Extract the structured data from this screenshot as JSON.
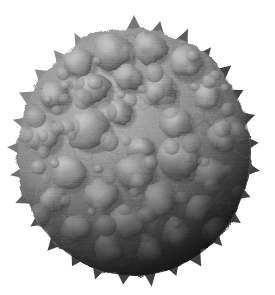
{
  "image": {
    "kind": "scientific-micrograph",
    "subject_name": "spiky-bumpy-spherical-particle",
    "description": "Grayscale electron-microscopy style rendering of a roughly spherical particle covered in rounded bumps and conical spikes, isolated on a plain white background",
    "alt_text": "Gray spherical particle with knobby bumps and spikes on white background",
    "background_color": "#ffffff",
    "render_style": "monochrome-grayscale",
    "texture": "fine horizontal scan-line striations over granular surface",
    "lighting": {
      "direction": "upper-left",
      "highlight_color": "#b9b9b9",
      "midtone_color": "#7d7d7d",
      "shadow_color": "#3a3a3a",
      "deep_shadow_color": "#232323"
    },
    "particle": {
      "center_x": 134,
      "center_y": 152,
      "radius_x": 116,
      "radius_y": 124,
      "bounds": {
        "left": 15,
        "top": 25,
        "right": 252,
        "bottom": 282
      },
      "body_fill_color": "#808080",
      "rim_shadow_color": "#2f2f2f"
    },
    "surface_features": {
      "bump_count": 58,
      "spike_count": 34,
      "bump_fill_color": "#8a8a8a",
      "bump_highlight_color": "#c2c2c2",
      "bump_shadow_color": "#404040",
      "spike_fill_color": "#707070",
      "bumps": [
        {
          "cx": 112,
          "cy": 52,
          "r": 20,
          "shade": 0.96
        },
        {
          "cx": 150,
          "cy": 48,
          "r": 15,
          "shade": 0.9
        },
        {
          "cx": 78,
          "cy": 62,
          "r": 16,
          "shade": 0.88
        },
        {
          "cx": 185,
          "cy": 62,
          "r": 17,
          "shade": 0.82
        },
        {
          "cx": 128,
          "cy": 78,
          "r": 14,
          "shade": 0.92
        },
        {
          "cx": 92,
          "cy": 88,
          "r": 18,
          "shade": 0.95
        },
        {
          "cx": 160,
          "cy": 90,
          "r": 16,
          "shade": 0.86
        },
        {
          "cx": 54,
          "cy": 96,
          "r": 15,
          "shade": 0.8
        },
        {
          "cx": 207,
          "cy": 96,
          "r": 14,
          "shade": 0.74
        },
        {
          "cx": 120,
          "cy": 112,
          "r": 13,
          "shade": 0.9
        },
        {
          "cx": 88,
          "cy": 128,
          "r": 21,
          "shade": 1.0
        },
        {
          "cx": 176,
          "cy": 122,
          "r": 16,
          "shade": 0.82
        },
        {
          "cx": 44,
          "cy": 136,
          "r": 16,
          "shade": 0.76
        },
        {
          "cx": 222,
          "cy": 136,
          "r": 14,
          "shade": 0.66
        },
        {
          "cx": 140,
          "cy": 148,
          "r": 14,
          "shade": 0.84
        },
        {
          "cx": 178,
          "cy": 158,
          "r": 21,
          "shade": 0.9
        },
        {
          "cx": 134,
          "cy": 172,
          "r": 19,
          "shade": 0.86
        },
        {
          "cx": 68,
          "cy": 172,
          "r": 17,
          "shade": 0.8
        },
        {
          "cx": 210,
          "cy": 174,
          "r": 15,
          "shade": 0.66
        },
        {
          "cx": 102,
          "cy": 196,
          "r": 17,
          "shade": 0.76
        },
        {
          "cx": 160,
          "cy": 200,
          "r": 17,
          "shade": 0.72
        },
        {
          "cx": 52,
          "cy": 200,
          "r": 14,
          "shade": 0.66
        },
        {
          "cx": 200,
          "cy": 208,
          "r": 14,
          "shade": 0.6
        },
        {
          "cx": 128,
          "cy": 222,
          "r": 16,
          "shade": 0.62
        },
        {
          "cx": 76,
          "cy": 228,
          "r": 14,
          "shade": 0.56
        },
        {
          "cx": 176,
          "cy": 232,
          "r": 14,
          "shade": 0.52
        },
        {
          "cx": 108,
          "cy": 248,
          "r": 14,
          "shade": 0.46
        },
        {
          "cx": 150,
          "cy": 250,
          "r": 13,
          "shade": 0.44
        }
      ],
      "spikes": [
        {
          "angle": -90,
          "length": 16
        },
        {
          "angle": -78,
          "length": 13
        },
        {
          "angle": -65,
          "length": 15
        },
        {
          "angle": -52,
          "length": 12
        },
        {
          "angle": -40,
          "length": 14
        },
        {
          "angle": -28,
          "length": 11
        },
        {
          "angle": -16,
          "length": 13
        },
        {
          "angle": -4,
          "length": 12
        },
        {
          "angle": 8,
          "length": 14
        },
        {
          "angle": 20,
          "length": 11
        },
        {
          "angle": 32,
          "length": 13
        },
        {
          "angle": 45,
          "length": 12
        },
        {
          "angle": 58,
          "length": 14
        },
        {
          "angle": 70,
          "length": 11
        },
        {
          "angle": 82,
          "length": 15
        },
        {
          "angle": 95,
          "length": 12
        },
        {
          "angle": 108,
          "length": 13
        },
        {
          "angle": 120,
          "length": 11
        },
        {
          "angle": 133,
          "length": 14
        },
        {
          "angle": 146,
          "length": 12
        },
        {
          "angle": 158,
          "length": 15
        },
        {
          "angle": 170,
          "length": 13
        },
        {
          "angle": 182,
          "length": 14
        },
        {
          "angle": 194,
          "length": 12
        },
        {
          "angle": 206,
          "length": 15
        },
        {
          "angle": 218,
          "length": 13
        },
        {
          "angle": 230,
          "length": 12
        },
        {
          "angle": 242,
          "length": 14
        }
      ]
    },
    "dimensions": {
      "width": 275,
      "height": 295
    }
  }
}
